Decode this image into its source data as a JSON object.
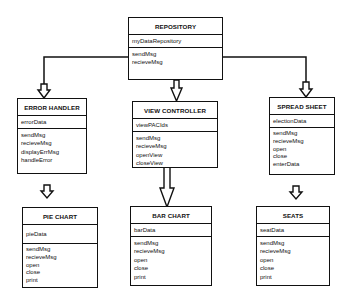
{
  "diagram": {
    "classes": {
      "repository": {
        "name": "REPOSITORY",
        "attributes": [
          "myDataRepository"
        ],
        "operations": [
          "sendMsg",
          "recieveMsg"
        ]
      },
      "error_handler": {
        "name": "ERROR HANDLER",
        "attributes": [
          "errorData"
        ],
        "operations": [
          "sendMsg",
          "recieveMsg",
          "displayErrMsg",
          "handleError"
        ]
      },
      "view_controller": {
        "name": "VIEW CONTROLLER",
        "attributes": [
          "viewPACIds"
        ],
        "operations": [
          "sendMsg",
          "recieveMsg",
          "openView",
          "closeView"
        ]
      },
      "spread_sheet": {
        "name": "SPREAD SHEET",
        "attributes": [
          "electionData"
        ],
        "operations": [
          "sendMsg",
          "recieveMsg",
          "open",
          "close",
          "enterData"
        ]
      },
      "pie_chart": {
        "name": "PIE CHART",
        "attributes": [
          "pieData"
        ],
        "operations": [
          "sendMsg",
          "recieveMsg",
          "open",
          "close",
          "print"
        ]
      },
      "bar_chart": {
        "name": "BAR CHART",
        "attributes": [
          "barData"
        ],
        "operations": [
          "sendMsg",
          "recieveMsg",
          "open",
          "close",
          "print"
        ]
      },
      "seats": {
        "name": "SEATS",
        "attributes": [
          "seatData"
        ],
        "operations": [
          "sendMsg",
          "recieveMsg",
          "open",
          "close",
          "print"
        ]
      }
    },
    "connections": [
      {
        "from": "REPOSITORY",
        "to": "ERROR HANDLER"
      },
      {
        "from": "REPOSITORY",
        "to": "VIEW CONTROLLER"
      },
      {
        "from": "REPOSITORY",
        "to": "SPREAD SHEET"
      },
      {
        "from": "ERROR HANDLER",
        "to": "PIE CHART"
      },
      {
        "from": "VIEW CONTROLLER",
        "to": "BAR CHART"
      },
      {
        "from": "SPREAD SHEET",
        "to": "SEATS"
      }
    ]
  }
}
